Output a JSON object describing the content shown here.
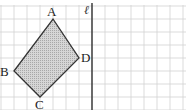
{
  "diagram": {
    "type": "grid-figure",
    "grid": {
      "cell_size_px": 13,
      "origin_x": 1,
      "origin_y": 6,
      "color": "#d2d2d2"
    },
    "line": {
      "label": "ℓ",
      "grid_col": 7,
      "color": "#333333"
    },
    "quadrilateral": {
      "fill": "#c9c9c9",
      "stroke": "#333333",
      "vertices": [
        {
          "label": "A",
          "col": 4,
          "row": 1
        },
        {
          "label": "D",
          "col": 6,
          "row": 4
        },
        {
          "label": "C",
          "col": 3,
          "row": 7
        },
        {
          "label": "B",
          "col": 1,
          "row": 5
        }
      ]
    }
  }
}
